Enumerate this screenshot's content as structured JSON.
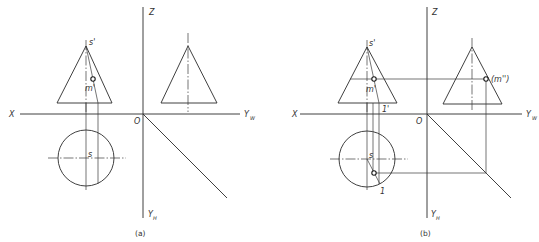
{
  "figure": {
    "panel_a": {
      "caption": "(a)",
      "labels": {
        "x_axis": "X",
        "z_axis": "Z",
        "origin": "O",
        "yw_axis": "Y",
        "yw_sub": "W",
        "yh_axis": "Y",
        "yh_sub": "H",
        "apex_front": "s'",
        "point_front": "m'",
        "apex_top": "s"
      }
    },
    "panel_b": {
      "caption": "(b)",
      "labels": {
        "x_axis": "X",
        "z_axis": "Z",
        "origin": "O",
        "yw_axis": "Y",
        "yw_sub": "W",
        "yh_axis": "Y",
        "yh_sub": "H",
        "apex_front": "s'",
        "point_front": "m'",
        "point_side": "(m'')",
        "base_point_front": "1'",
        "apex_top": "s",
        "base_point_top": "1"
      }
    },
    "colors": {
      "line": "#2a2a2a",
      "background": "#ffffff"
    }
  }
}
